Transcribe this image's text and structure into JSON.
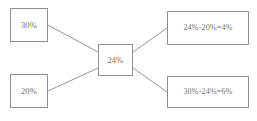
{
  "diagram": {
    "background_color": "#ffffff",
    "border_color": "#8f8f8f",
    "text_color": "#6f6f6f",
    "edge_color": "#8a8a8a",
    "nodes": {
      "top_left": {
        "label": "30%"
      },
      "bottom_left": {
        "label": "20%"
      },
      "center": {
        "label": "24%"
      },
      "top_right": {
        "label": "24%-20%=4%"
      },
      "bottom_right": {
        "label": "30%-24%=6%"
      }
    },
    "edges": [
      {
        "name": "edge-top-left-to-center",
        "from": "top_left",
        "to": "center"
      },
      {
        "name": "edge-bottom-left-to-center",
        "from": "bottom_left",
        "to": "center"
      },
      {
        "name": "edge-center-to-top-right",
        "from": "center",
        "to": "top_right"
      },
      {
        "name": "edge-center-to-bottom-right",
        "from": "center",
        "to": "bottom_right"
      }
    ]
  }
}
